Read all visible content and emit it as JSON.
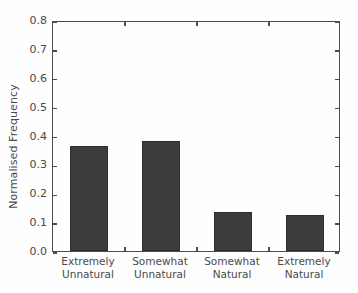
{
  "chart_data": {
    "type": "bar",
    "title": "",
    "xlabel": "",
    "ylabel": "Normalised Frequency",
    "categories": [
      "Extremely Unnatural",
      "Somewhat Unnatural",
      "Somewhat Natural",
      "Extremely Natural"
    ],
    "category_lines": [
      [
        "Extremely",
        "Unnatural"
      ],
      [
        "Somewhat",
        "Unnatural"
      ],
      [
        "Somewhat",
        "Natural"
      ],
      [
        "Extremely",
        "Natural"
      ]
    ],
    "values": [
      0.365,
      0.38,
      0.135,
      0.125
    ],
    "ylim": [
      0.0,
      0.8
    ],
    "ytick_values": [
      0.0,
      0.1,
      0.2,
      0.3,
      0.4,
      0.5,
      0.6,
      0.7,
      0.8
    ],
    "ytick_labels": [
      "0.0",
      "0.1",
      "0.2",
      "0.3",
      "0.4",
      "0.5",
      "0.6",
      "0.7",
      "0.8"
    ],
    "grid": false,
    "legend": null,
    "bar_color": "#3d3d3d",
    "axis_color": "#4d4d4d",
    "text_color": "#4a4a4a",
    "background_color": "#ffffff"
  }
}
